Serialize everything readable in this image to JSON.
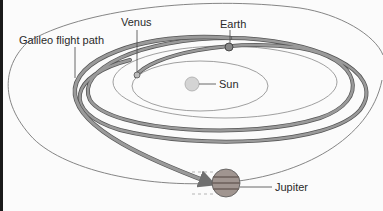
{
  "diagram": {
    "labels": {
      "flight_path": "Galileo flight path",
      "venus": "Venus",
      "earth": "Earth",
      "sun": "Sun",
      "jupiter": "Jupiter"
    },
    "colors": {
      "background": "#fbfbfb",
      "orbit_line": "#777777",
      "flight_path": "#8a8a8a",
      "flight_path_edge": "#555555",
      "text": "#2a2a2a",
      "sun": "#cfcfcf",
      "jupiter": "#9a8f8a"
    }
  }
}
